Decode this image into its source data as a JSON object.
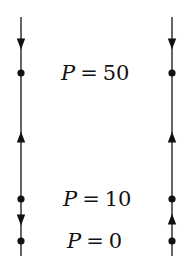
{
  "diagram": {
    "type": "phase-lines",
    "colors": {
      "line": "#111111",
      "background": "#ffffff"
    },
    "equilibria": [
      {
        "variable": "P",
        "equals": "=",
        "value": "50",
        "y": 73,
        "label_x": 61
      },
      {
        "variable": "P",
        "equals": "=",
        "value": "10",
        "y": 199,
        "label_x": 63
      },
      {
        "variable": "P",
        "equals": "=",
        "value": "0",
        "y": 241,
        "label_x": 67
      }
    ],
    "phase_lines": [
      {
        "name": "left",
        "x": 21,
        "y_top": 17,
        "y_bottom": 256,
        "dots": [
          73,
          199,
          241
        ],
        "arrows": [
          {
            "y": 44,
            "direction": "down"
          },
          {
            "y": 137,
            "direction": "up"
          },
          {
            "y": 220,
            "direction": "down"
          }
        ]
      },
      {
        "name": "right",
        "x": 172,
        "y_top": 17,
        "y_bottom": 256,
        "dots": [
          73,
          199,
          241
        ],
        "arrows": [
          {
            "y": 44,
            "direction": "down"
          },
          {
            "y": 137,
            "direction": "up"
          },
          {
            "y": 219,
            "direction": "up"
          }
        ]
      }
    ]
  }
}
